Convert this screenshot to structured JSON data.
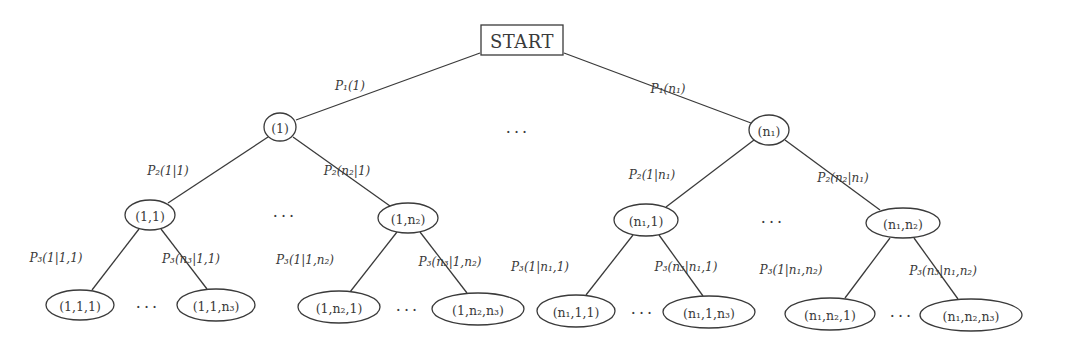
{
  "colors": {
    "stroke": "#3a3a3a",
    "text": "#3a3a3a",
    "background": "#ffffff"
  },
  "root": {
    "id": "start",
    "label": "START",
    "x": 522,
    "y": 40,
    "w": 82,
    "h": 30
  },
  "nodes": [
    {
      "id": "n-1",
      "label": "(1)",
      "x": 280,
      "y": 127,
      "rx": 16,
      "ry": 14
    },
    {
      "id": "n-n1",
      "label": "(n₁)",
      "x": 769,
      "y": 130,
      "rx": 20,
      "ry": 15
    },
    {
      "id": "n-1-1",
      "label": "(1,1)",
      "x": 150,
      "y": 215,
      "rx": 25,
      "ry": 15
    },
    {
      "id": "n-1-n2",
      "label": "(1,n₂)",
      "x": 408,
      "y": 218,
      "rx": 30,
      "ry": 15
    },
    {
      "id": "n-n1-1",
      "label": "(n₁,1)",
      "x": 646,
      "y": 220,
      "rx": 32,
      "ry": 16
    },
    {
      "id": "n-n1-n2",
      "label": "(n₁,n₂)",
      "x": 903,
      "y": 223,
      "rx": 37,
      "ry": 15
    },
    {
      "id": "n-1-1-1",
      "label": "(1,1,1)",
      "x": 80,
      "y": 305,
      "rx": 34,
      "ry": 15
    },
    {
      "id": "n-1-1-n3",
      "label": "(1,1,n₃)",
      "x": 216,
      "y": 305,
      "rx": 39,
      "ry": 16
    },
    {
      "id": "n-1-n2-1",
      "label": "(1,n₂,1)",
      "x": 339,
      "y": 307,
      "rx": 41,
      "ry": 16
    },
    {
      "id": "n-1-n2-n3",
      "label": "(1,n₂,n₃)",
      "x": 478,
      "y": 309,
      "rx": 46,
      "ry": 16
    },
    {
      "id": "n-n1-1-1",
      "label": "(n₁,1,1)",
      "x": 576,
      "y": 311,
      "rx": 39,
      "ry": 16
    },
    {
      "id": "n-n1-1-n3",
      "label": "(n₁,1,n₃)",
      "x": 709,
      "y": 312,
      "rx": 46,
      "ry": 16
    },
    {
      "id": "n-n1-n2-1",
      "label": "(n₁,n₂,1)",
      "x": 830,
      "y": 314,
      "rx": 45,
      "ry": 16
    },
    {
      "id": "n-n1-n2-n3",
      "label": "(n₁,n₂,n₃)",
      "x": 971,
      "y": 315,
      "rx": 51,
      "ry": 16
    }
  ],
  "edges": [
    {
      "from": [
        480,
        53
      ],
      "to": [
        296,
        120
      ],
      "label": "P₁(1)",
      "lx": 350,
      "ly": 90
    },
    {
      "from": [
        564,
        53
      ],
      "to": [
        751,
        123
      ],
      "label": "P₁(n₁)",
      "lx": 668,
      "ly": 93
    },
    {
      "from": [
        268,
        137
      ],
      "to": [
        168,
        203
      ],
      "label": "P₂(1|1)",
      "lx": 168,
      "ly": 175
    },
    {
      "from": [
        293,
        137
      ],
      "to": [
        390,
        206
      ],
      "label": "P₂(n₂|1)",
      "lx": 347,
      "ly": 175
    },
    {
      "from": [
        754,
        140
      ],
      "to": [
        666,
        207
      ],
      "label": "P₂(1|n₁)",
      "lx": 652,
      "ly": 179
    },
    {
      "from": [
        785,
        140
      ],
      "to": [
        880,
        210
      ],
      "label": "P₂(n₂|n₁)",
      "lx": 843,
      "ly": 182
    },
    {
      "from": [
        139,
        229
      ],
      "to": [
        92,
        290
      ],
      "label": "P₃(1|1,1)",
      "lx": 56,
      "ly": 262
    },
    {
      "from": [
        161,
        229
      ],
      "to": [
        207,
        289
      ],
      "label": "P₃(n₃|1,1)",
      "lx": 191,
      "ly": 263
    },
    {
      "from": [
        397,
        232
      ],
      "to": [
        350,
        292
      ],
      "label": "P₃(1|1,n₂)",
      "lx": 305,
      "ly": 264
    },
    {
      "from": [
        420,
        232
      ],
      "to": [
        467,
        293
      ],
      "label": "P₃(n₃|1,n₂)",
      "lx": 450,
      "ly": 266
    },
    {
      "from": [
        633,
        235
      ],
      "to": [
        586,
        295
      ],
      "label": "P₃(1|n₁,1)",
      "lx": 540,
      "ly": 271
    },
    {
      "from": [
        659,
        235
      ],
      "to": [
        703,
        296
      ],
      "label": "P₃(n₃|n₁,1)",
      "lx": 686,
      "ly": 271
    },
    {
      "from": [
        890,
        238
      ],
      "to": [
        845,
        298
      ],
      "label": "P₃(1|n₁,n₂)",
      "lx": 791,
      "ly": 274
    },
    {
      "from": [
        914,
        238
      ],
      "to": [
        958,
        299
      ],
      "label": "P₃(n₃|n₁,n₂)",
      "lx": 943,
      "ly": 275
    }
  ],
  "ellipses": [
    {
      "id": "dots-level1",
      "label": "···",
      "x": 518,
      "y": 132
    },
    {
      "id": "dots-level2-left",
      "label": "···",
      "x": 285,
      "y": 216
    },
    {
      "id": "dots-level2-right",
      "label": "···",
      "x": 773,
      "y": 222
    },
    {
      "id": "dots-leaf-1",
      "label": "···",
      "x": 148,
      "y": 307
    },
    {
      "id": "dots-leaf-2",
      "label": "···",
      "x": 408,
      "y": 310
    },
    {
      "id": "dots-leaf-3",
      "label": "···",
      "x": 643,
      "y": 313
    },
    {
      "id": "dots-leaf-4",
      "label": "···",
      "x": 902,
      "y": 316
    }
  ]
}
